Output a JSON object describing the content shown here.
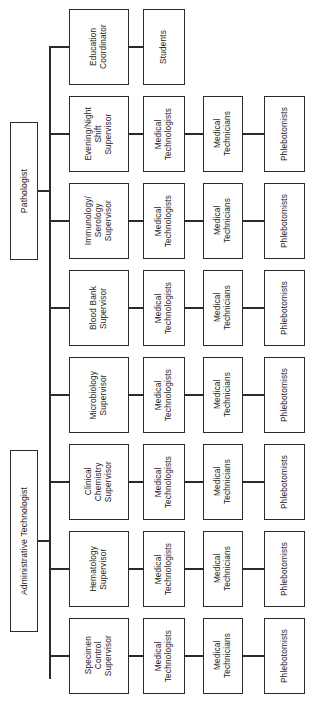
{
  "chart": {
    "orientation": "horizontal-rotated-text",
    "line_color": "#2b2b2b",
    "box_fill": "#ffffff",
    "roots": [
      {
        "id": "pathologist",
        "label": "Pathologist"
      },
      {
        "id": "administrative-technologist",
        "label": "Administrative Technologist"
      }
    ],
    "rows": [
      {
        "id": "row-education",
        "supervisor": "Education\nCoordinator",
        "staff": [
          "Students"
        ]
      },
      {
        "id": "row-evening-night",
        "supervisor": "Evening/Night\nShift\nSupervisor",
        "staff": [
          "Medical\nTechnologists",
          "Medical\nTechnicians",
          "Phlebotomists"
        ]
      },
      {
        "id": "row-immunology",
        "supervisor": "Immunology/\nSerology\nSupervisor",
        "staff": [
          "Medical\nTechnologists",
          "Medical\nTechnicians",
          "Phlebotomists"
        ]
      },
      {
        "id": "row-blood-bank",
        "supervisor": "Blood Bank\nSupervisor",
        "staff": [
          "Medical\nTechnologists",
          "Medical\nTechnicians",
          "Phlebotomists"
        ]
      },
      {
        "id": "row-microbiology",
        "supervisor": "Microbiology\nSupervisor",
        "staff": [
          "Medical\nTechnologists",
          "Medical\nTechnicians",
          "Phlebotomists"
        ]
      },
      {
        "id": "row-clinical-chemistry",
        "supervisor": "Clinical\nChemistry\nSupervisor",
        "staff": [
          "Medical\nTechnologists",
          "Medical\nTechnicians",
          "Phlebotomists"
        ]
      },
      {
        "id": "row-hematology",
        "supervisor": "Hematology\nSupervisor",
        "staff": [
          "Medical\nTechnologists",
          "Medical\nTechnicians",
          "Phlebotomists"
        ]
      },
      {
        "id": "row-specimen-control",
        "supervisor": "Specimen\nControl\nSupervisor",
        "staff": [
          "Medical\nTechnologists",
          "Medical\nTechnicians",
          "Phlebotomists"
        ]
      }
    ]
  }
}
